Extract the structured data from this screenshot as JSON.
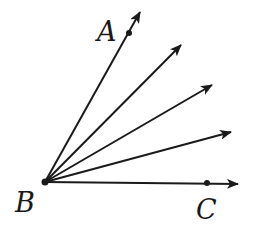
{
  "diagram": {
    "type": "rays-from-common-vertex",
    "color": "#1a1a1a",
    "vertex": {
      "label": "B",
      "x": 45,
      "y": 182
    },
    "rays": [
      {
        "id": "ray-BA",
        "end_x": 140,
        "end_y": 12,
        "point": {
          "label": "A",
          "x": 129,
          "y": 33
        }
      },
      {
        "id": "ray-2",
        "end_x": 181,
        "end_y": 45
      },
      {
        "id": "ray-3",
        "end_x": 212,
        "end_y": 85
      },
      {
        "id": "ray-4",
        "end_x": 231,
        "end_y": 132
      },
      {
        "id": "ray-BC",
        "end_x": 238,
        "end_y": 184,
        "point": {
          "label": "C",
          "x": 207,
          "y": 183
        }
      }
    ],
    "labels": {
      "A": "A",
      "B": "B",
      "C": "C"
    }
  }
}
